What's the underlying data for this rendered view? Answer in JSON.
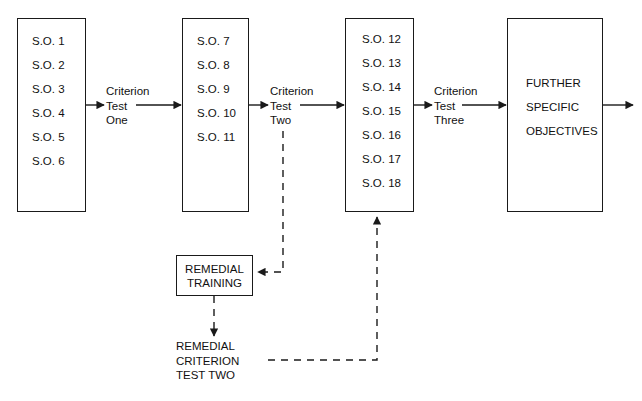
{
  "diagram": {
    "stroke_color": "#1a1a1a",
    "text_color": "#111111",
    "background_color": "#ffffff",
    "stages": [
      {
        "id": "stage-1",
        "objectives": [
          "S.O. 1",
          "S.O. 2",
          "S.O. 3",
          "S.O. 4",
          "S.O. 5",
          "S.O. 6"
        ]
      },
      {
        "id": "stage-2",
        "objectives": [
          "S.O. 7",
          "S.O. 8",
          "S.O. 9",
          "S.O. 10",
          "S.O. 11"
        ]
      },
      {
        "id": "stage-3",
        "objectives": [
          "S.O. 12",
          "S.O. 13",
          "S.O. 14",
          "S.O. 15",
          "S.O. 16",
          "S.O. 17",
          "S.O. 18"
        ]
      }
    ],
    "final_box": {
      "id": "further-specific-objectives",
      "lines": [
        "FURTHER",
        "SPECIFIC",
        "OBJECTIVES"
      ]
    },
    "criterion_tests": [
      {
        "id": "criterion-test-one",
        "lines": [
          "Criterion",
          "Test",
          "One"
        ]
      },
      {
        "id": "criterion-test-two",
        "lines": [
          "Criterion",
          "Test",
          "Two"
        ]
      },
      {
        "id": "criterion-test-three",
        "lines": [
          "Criterion",
          "Test",
          "Three"
        ]
      }
    ],
    "remedial_training": {
      "id": "remedial-training",
      "lines": [
        "REMEDIAL",
        "TRAINING"
      ]
    },
    "remedial_criterion_test": {
      "id": "remedial-criterion-test-two",
      "lines": [
        "REMEDIAL",
        "CRITERION",
        "TEST TWO"
      ]
    }
  }
}
